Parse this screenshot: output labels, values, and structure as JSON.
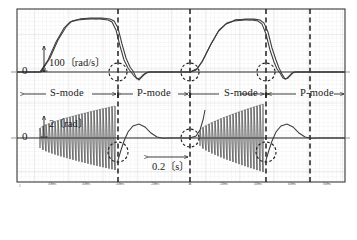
{
  "figure": {
    "plot_area": {
      "x": 17,
      "y": 9,
      "width": 328,
      "height": 173
    },
    "border_color": "#3a3a3a",
    "grid_color": "#d8d8d8",
    "trace_color": "#3c3c3c",
    "dashed_color": "#1e1e1e",
    "background": "#ffffff"
  },
  "axis_labels": {
    "zero_top": "0",
    "zero_bottom": "0",
    "scale_top": "100〔rad/s〕",
    "scale_bottom": "2〔rad〕"
  },
  "mode_labels": [
    {
      "label": "S-mode",
      "center_x": 68
    },
    {
      "label": "P-mode",
      "center_x": 155
    },
    {
      "label": "S-mode",
      "center_x": 243
    },
    {
      "label": "P-mode",
      "center_x": 320
    }
  ],
  "time_annotation": {
    "label": "0.2〔s〕",
    "arrow_from_x": 148,
    "arrow_to_x": 190,
    "arrow_y": 157,
    "label_x": 169,
    "label_y": 168
  },
  "transition_lines_x": [
    118,
    190,
    266,
    310
  ],
  "highlight_circles": [
    {
      "cx": 118,
      "cy": 72,
      "r": 9
    },
    {
      "cx": 190,
      "cy": 72,
      "r": 9
    },
    {
      "cx": 266,
      "cy": 72,
      "r": 9
    },
    {
      "cx": 118,
      "cy": 152,
      "r": 10
    },
    {
      "cx": 190,
      "cy": 138,
      "r": 9
    },
    {
      "cx": 266,
      "cy": 152,
      "r": 10
    }
  ],
  "x_tick_labels": [
    {
      "text": "-800ms",
      "x": 52
    },
    {
      "text": "-600ms",
      "x": 86
    },
    {
      "text": "-400ms",
      "x": 120
    },
    {
      "text": "-200ms",
      "x": 155
    },
    {
      "text": "0s",
      "x": 190
    },
    {
      "text": "200ms",
      "x": 224
    },
    {
      "text": "400ms",
      "x": 258
    },
    {
      "text": "600ms",
      "x": 292
    },
    {
      "text": "800ms",
      "x": 327
    }
  ],
  "corner_mark": "1",
  "chart_data": {
    "type": "line",
    "xlabel": "time",
    "ylabel": "angular velocity / angle",
    "grid": true,
    "legend": "none",
    "xlim": [
      -900,
      900
    ],
    "x_unit": "ms",
    "subplots": [
      {
        "name": "angular-velocity",
        "ylabel": "100〔rad/s〕 per division",
        "baseline_y": 72,
        "unit": "rad/s",
        "description": "Two nearly overlapping trapezoidal velocity traces (reference and response) rising from 0, holding a plateau, then falling back to 0 with small undershoot ringing at each transition.",
        "series": [
          {
            "name": "reference",
            "points_px": [
              [
                17,
                72
              ],
              [
                40,
                72
              ],
              [
                48,
                60
              ],
              [
                56,
                42
              ],
              [
                64,
                28
              ],
              [
                70,
                22
              ],
              [
                78,
                20
              ],
              [
                88,
                19
              ],
              [
                100,
                19
              ],
              [
                108,
                20
              ],
              [
                112,
                22
              ],
              [
                116,
                30
              ],
              [
                120,
                46
              ],
              [
                124,
                60
              ],
              [
                128,
                68
              ],
              [
                131,
                72
              ],
              [
                134,
                76
              ],
              [
                137,
                79
              ],
              [
                140,
                78
              ],
              [
                143,
                75
              ],
              [
                146,
                73
              ],
              [
                150,
                72
              ],
              [
                190,
                72
              ],
              [
                196,
                70
              ],
              [
                202,
                62
              ],
              [
                210,
                46
              ],
              [
                218,
                32
              ],
              [
                226,
                24
              ],
              [
                234,
                21
              ],
              [
                244,
                20
              ],
              [
                252,
                20
              ],
              [
                258,
                21
              ],
              [
                262,
                24
              ],
              [
                266,
                34
              ],
              [
                270,
                50
              ],
              [
                274,
                62
              ],
              [
                277,
                69
              ],
              [
                280,
                73
              ],
              [
                283,
                78
              ],
              [
                286,
                79
              ],
              [
                289,
                76
              ],
              [
                292,
                73
              ],
              [
                296,
                72
              ],
              [
                345,
                72
              ]
            ]
          },
          {
            "name": "response",
            "points_px": [
              [
                17,
                72
              ],
              [
                41,
                72
              ],
              [
                50,
                58
              ],
              [
                58,
                40
              ],
              [
                66,
                27
              ],
              [
                72,
                21
              ],
              [
                80,
                19
              ],
              [
                90,
                18
              ],
              [
                102,
                18
              ],
              [
                110,
                19
              ],
              [
                114,
                21
              ],
              [
                118,
                28
              ],
              [
                122,
                44
              ],
              [
                126,
                58
              ],
              [
                130,
                67
              ],
              [
                133,
                71
              ],
              [
                136,
                77
              ],
              [
                139,
                80
              ],
              [
                142,
                77
              ],
              [
                145,
                74
              ],
              [
                148,
                72
              ],
              [
                152,
                72
              ],
              [
                190,
                72
              ],
              [
                197,
                69
              ],
              [
                203,
                60
              ],
              [
                211,
                44
              ],
              [
                219,
                30
              ],
              [
                227,
                23
              ],
              [
                236,
                20
              ],
              [
                246,
                19
              ],
              [
                254,
                19
              ],
              [
                260,
                20
              ],
              [
                264,
                23
              ],
              [
                268,
                32
              ],
              [
                272,
                48
              ],
              [
                276,
                60
              ],
              [
                279,
                68
              ],
              [
                282,
                74
              ],
              [
                285,
                79
              ],
              [
                288,
                78
              ],
              [
                291,
                75
              ],
              [
                294,
                72
              ],
              [
                298,
                72
              ],
              [
                345,
                72
              ]
            ]
          }
        ]
      },
      {
        "name": "angle",
        "ylabel": "2〔rad〕 per division",
        "baseline_y": 138,
        "unit": "rad",
        "description": "High-frequency oscillation bursts with growing amplitude during each S-mode interval, decaying to a smooth single hump during each P-mode interval.",
        "bursts": [
          {
            "mode": "S-mode",
            "x_start": 40,
            "x_end": 118,
            "cycles": 26,
            "amplitude_start_px": 10,
            "amplitude_end_px": 32,
            "baseline_y": 138
          },
          {
            "mode": "S-mode",
            "x_start": 200,
            "x_end": 266,
            "cycles": 22,
            "amplitude_start_px": 8,
            "amplitude_end_px": 34,
            "baseline_y": 138
          }
        ],
        "p_mode_humps": [
          {
            "x_start": 122,
            "x_peak": 141,
            "x_end": 165,
            "amplitude_px": 14,
            "baseline_y": 138
          },
          {
            "x_start": 270,
            "x_peak": 289,
            "x_end": 312,
            "amplitude_px": 14,
            "baseline_y": 138
          }
        ]
      }
    ]
  }
}
